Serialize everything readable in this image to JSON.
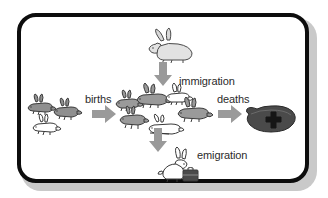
{
  "figure": {
    "kind": "population-dynamics-diagram",
    "frame": {
      "border_color": "#0d0d0d",
      "background_color": "#ffffff",
      "shadow_color": "#c9c9c9"
    }
  },
  "labels": {
    "births": "births",
    "immigration": "immigration",
    "deaths": "deaths",
    "emigration": "emigration"
  },
  "arrows": [
    {
      "name": "births-arrow",
      "direction": "right",
      "color": "#9a9a9a",
      "label": "births"
    },
    {
      "name": "immigration-arrow",
      "direction": "down",
      "color": "#9a9a9a",
      "label": "immigration"
    },
    {
      "name": "deaths-arrow",
      "direction": "right",
      "color": "#9a9a9a",
      "label": "deaths"
    },
    {
      "name": "emigration-arrow",
      "direction": "down",
      "color": "#9a9a9a",
      "label": "emigration"
    }
  ],
  "groups": [
    {
      "name": "source-rabbits",
      "description": "small group of rabbits entering through births",
      "count": 3,
      "colors": [
        "#8f8f8f",
        "#8f8f8f",
        "#ffffff"
      ]
    },
    {
      "name": "population-rabbits",
      "description": "central rabbit population",
      "count": 6,
      "colors": [
        "#9a9a9a",
        "#9a9a9a",
        "#ffffff",
        "#9a9a9a",
        "#9a9a9a",
        "#ffffff"
      ]
    },
    {
      "name": "immigrating-rabbit",
      "description": "rabbit arriving from outside the population",
      "count": 1,
      "colors": [
        "#e2e2e2"
      ]
    },
    {
      "name": "emigrating-rabbit",
      "description": "rabbit leaving the population carrying a suitcase",
      "count": 1,
      "colors": [
        "#ffffff"
      ],
      "accessory": "suitcase"
    },
    {
      "name": "grave",
      "description": "dark grave mound marked with a cross representing deaths",
      "count": 1,
      "colors": [
        "#4a4a4a"
      ],
      "marker": "cross"
    }
  ],
  "palette": {
    "outline": "#3a3a3a",
    "rabbit_gray": "#9a9a9a",
    "rabbit_white": "#ffffff",
    "arrow_gray": "#9a9a9a",
    "grave_dark": "#4a4a4a",
    "text": "#2b2b2b"
  }
}
